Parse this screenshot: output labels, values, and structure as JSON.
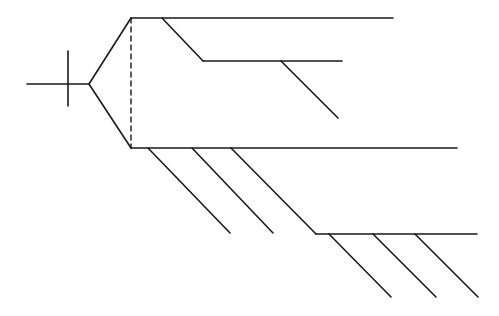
{
  "diagram": {
    "type": "tree",
    "stroke_color": "#1a1a1a",
    "background": "#ffffff",
    "root": {
      "stem": {
        "x1": 27,
        "y1": 84,
        "x2": 89,
        "y2": 84
      },
      "tick": {
        "x1": 68,
        "y1": 51,
        "x2": 68,
        "y2": 106
      },
      "fork_upper": {
        "x1": 89,
        "y1": 84,
        "x2": 131,
        "y2": 18
      },
      "fork_lower": {
        "x1": 89,
        "y1": 84,
        "x2": 131,
        "y2": 148
      },
      "dashed_link": {
        "x1": 131,
        "y1": 18,
        "x2": 131,
        "y2": 148
      }
    },
    "upper_clade": {
      "main": {
        "x1": 131,
        "y1": 18,
        "x2": 393,
        "y2": 18
      },
      "branch_diag": {
        "x1": 162,
        "y1": 18,
        "x2": 203,
        "y2": 61
      },
      "branch_horiz": {
        "x1": 203,
        "y1": 61,
        "x2": 342,
        "y2": 61
      },
      "sub_diag": {
        "x1": 281,
        "y1": 61,
        "x2": 338,
        "y2": 118
      }
    },
    "lower_clade": {
      "main": {
        "x1": 131,
        "y1": 148,
        "x2": 457,
        "y2": 148
      },
      "diags": [
        {
          "x1": 148,
          "y1": 148,
          "x2": 230,
          "y2": 233
        },
        {
          "x1": 192,
          "y1": 148,
          "x2": 273,
          "y2": 233
        },
        {
          "x1": 231,
          "y1": 148,
          "x2": 316,
          "y2": 234
        }
      ],
      "sub_horiz": {
        "x1": 316,
        "y1": 234,
        "x2": 477,
        "y2": 234
      },
      "sub_diags": [
        {
          "x1": 329,
          "y1": 234,
          "x2": 391,
          "y2": 297
        },
        {
          "x1": 373,
          "y1": 234,
          "x2": 436,
          "y2": 297
        },
        {
          "x1": 415,
          "y1": 234,
          "x2": 478,
          "y2": 297
        }
      ]
    }
  }
}
